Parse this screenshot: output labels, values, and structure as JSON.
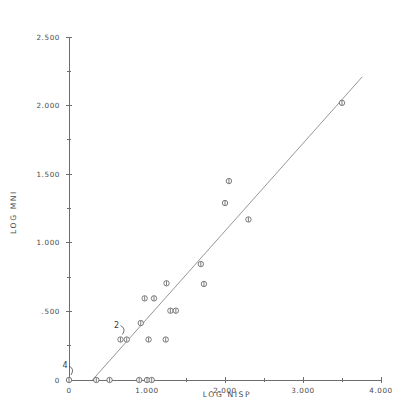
{
  "chart_data": {
    "type": "scatter",
    "title": "",
    "xlabel": "LOG NISP",
    "ylabel": "LOG MNI",
    "xlim": [
      0,
      4.0
    ],
    "ylim": [
      0,
      2.5
    ],
    "grid": false,
    "legend": null,
    "x_ticks": [
      {
        "value": 0,
        "label": "0"
      },
      {
        "value": 0.5,
        "label": ""
      },
      {
        "value": 1.0,
        "label": "1.000"
      },
      {
        "value": 1.5,
        "label": ""
      },
      {
        "value": 2.0,
        "label": "2.000"
      },
      {
        "value": 2.5,
        "label": ""
      },
      {
        "value": 3.0,
        "label": "3.000"
      },
      {
        "value": 3.5,
        "label": ""
      },
      {
        "value": 4.0,
        "label": "4.000"
      }
    ],
    "y_ticks": [
      {
        "value": 0,
        "label": "0"
      },
      {
        "value": 0.25,
        "label": ""
      },
      {
        "value": 0.5,
        "label": ".500"
      },
      {
        "value": 0.75,
        "label": ""
      },
      {
        "value": 1.0,
        "label": "1.000"
      },
      {
        "value": 1.25,
        "label": ""
      },
      {
        "value": 1.5,
        "label": "1.500"
      },
      {
        "value": 1.75,
        "label": ""
      },
      {
        "value": 2.0,
        "label": "2.000"
      },
      {
        "value": 2.25,
        "label": ""
      },
      {
        "value": 2.5,
        "label": "2.500"
      }
    ],
    "points": [
      {
        "x": 0.0,
        "y": 0.0
      },
      {
        "x": 0.35,
        "y": 0.0
      },
      {
        "x": 0.52,
        "y": 0.0
      },
      {
        "x": 0.9,
        "y": 0.0
      },
      {
        "x": 1.0,
        "y": 0.0
      },
      {
        "x": 1.06,
        "y": 0.0
      },
      {
        "x": 0.66,
        "y": 0.295
      },
      {
        "x": 0.74,
        "y": 0.295
      },
      {
        "x": 1.02,
        "y": 0.295
      },
      {
        "x": 1.24,
        "y": 0.295
      },
      {
        "x": 0.92,
        "y": 0.415
      },
      {
        "x": 1.3,
        "y": 0.505
      },
      {
        "x": 1.37,
        "y": 0.505
      },
      {
        "x": 0.97,
        "y": 0.595
      },
      {
        "x": 1.09,
        "y": 0.595
      },
      {
        "x": 1.25,
        "y": 0.705
      },
      {
        "x": 1.73,
        "y": 0.7
      },
      {
        "x": 1.69,
        "y": 0.845
      },
      {
        "x": 2.0,
        "y": 1.29
      },
      {
        "x": 2.05,
        "y": 1.45
      },
      {
        "x": 2.3,
        "y": 1.17
      },
      {
        "x": 3.5,
        "y": 2.02
      }
    ],
    "annotations": [
      {
        "label": "4",
        "x": 0.0,
        "y": 0.0,
        "note": "four coincident points at origin"
      },
      {
        "label": "2",
        "x": 0.66,
        "y": 0.295,
        "note": "two coincident points"
      }
    ],
    "fit_line": {
      "x_start": 0.3,
      "y_start": 0.0,
      "x_end": 3.76,
      "y_end": 2.21
    }
  }
}
